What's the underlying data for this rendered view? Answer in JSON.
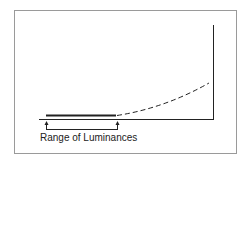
{
  "diagram": {
    "label": "Range of Luminances",
    "colors": {
      "frame": "#9a9a9a",
      "line": "#222222",
      "background": "#ffffff"
    },
    "elements": {
      "solid_segment": "constant response over range of luminances",
      "dashed_curve": "rising response beyond range",
      "axes": "x-axis and right vertical axis"
    }
  }
}
